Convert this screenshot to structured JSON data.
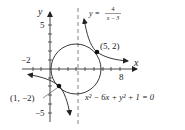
{
  "axes": {
    "x_label": "x",
    "y_label": "y",
    "tick_labels": {
      "x_neg": "−2",
      "x_pos": "8",
      "y_pos": "5",
      "y_neg": "−5"
    }
  },
  "curves": {
    "hyperbola_label_lhs": "y =",
    "hyperbola_numerator": "4",
    "hyperbola_denominator": "x − 3",
    "circle_equation": "x² − 6x + y² + 1 = 0"
  },
  "points": {
    "p1": "(5, 2)",
    "p2": "(1, −2)"
  },
  "colors": {
    "curve": "#222222",
    "asymptote": "#777777"
  }
}
